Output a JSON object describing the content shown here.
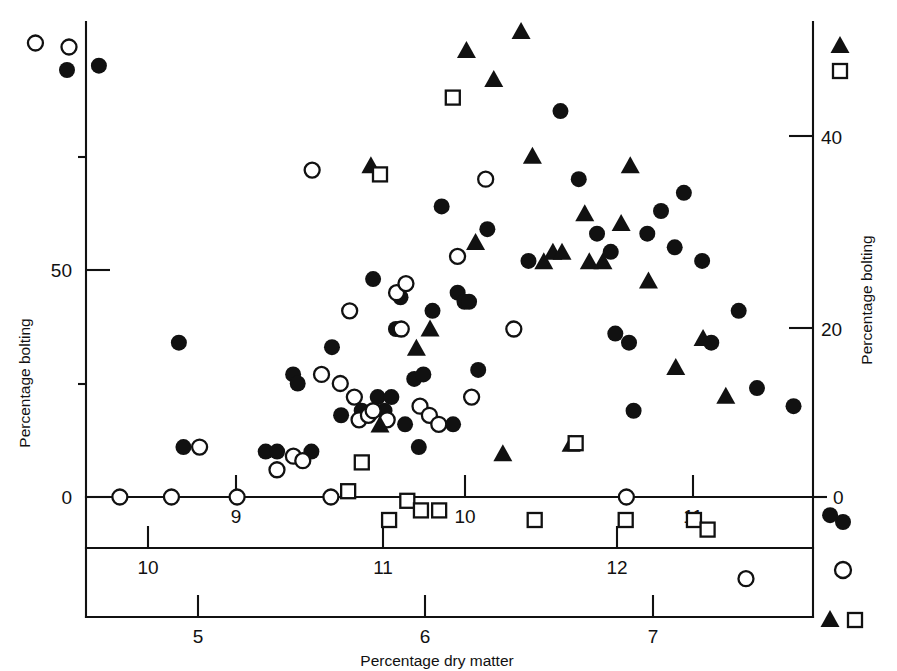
{
  "figure": {
    "background": "#ffffff",
    "ink_color": "#111111"
  },
  "chart_data": {
    "type": "scatter",
    "title": "",
    "xlabel": "Percentage dry matter",
    "ylabel": "Percentage bolting",
    "ylabel_right": "Percentage bolting",
    "grid": false,
    "legend_position": "axis-end-markers",
    "axes": {
      "y_left": {
        "label": "Percentage bolting",
        "ticks": [
          0,
          50
        ],
        "tick_labels": [
          "0",
          "50"
        ],
        "minor_ticks": [
          25,
          75
        ],
        "range": [
          0,
          100
        ],
        "series_markers": [
          "open-circle",
          "filled-circle"
        ]
      },
      "y_right": {
        "label": "Percentage bolting",
        "ticks": [
          20,
          40
        ],
        "tick_labels": [
          "20",
          "40"
        ],
        "range": [
          0,
          52
        ],
        "series_markers": [
          "filled-triangle",
          "open-square"
        ]
      },
      "x_bottom": {
        "label": "Percentage dry matter",
        "ticks": [
          5,
          6,
          7
        ],
        "tick_labels": [
          "5",
          "6",
          "7"
        ],
        "range": [
          4.45,
          7.65
        ],
        "series_markers": [
          "filled-triangle",
          "open-square"
        ]
      },
      "x_middle": {
        "ticks": [
          10,
          11,
          12
        ],
        "tick_labels": [
          "10",
          "11",
          "12"
        ],
        "range": [
          9.5,
          12.6
        ],
        "series_markers": [
          "open-circle"
        ]
      },
      "x_top": {
        "ticks": [
          9,
          10,
          11
        ],
        "tick_labels": [
          "9",
          "10",
          "11"
        ],
        "range": [
          8.4,
          11.6
        ],
        "series_markers": [
          "filled-circle"
        ]
      }
    },
    "series": [
      {
        "name": "Filled circles",
        "marker": "filled-circle",
        "x_axis": "x_top",
        "y_axis": "y_left",
        "count": 47,
        "points": [
          [
            8.4,
            95
          ],
          [
            8.75,
            34
          ],
          [
            8.77,
            11
          ],
          [
            9.13,
            10
          ],
          [
            9.18,
            10
          ],
          [
            9.25,
            27
          ],
          [
            9.27,
            25
          ],
          [
            9.33,
            10
          ],
          [
            9.42,
            33
          ],
          [
            9.46,
            18
          ],
          [
            9.55,
            19
          ],
          [
            9.6,
            48
          ],
          [
            9.62,
            22
          ],
          [
            9.65,
            19
          ],
          [
            9.68,
            22
          ],
          [
            9.7,
            37
          ],
          [
            9.72,
            44
          ],
          [
            9.74,
            16
          ],
          [
            9.78,
            26
          ],
          [
            9.8,
            11
          ],
          [
            9.82,
            27
          ],
          [
            9.86,
            41
          ],
          [
            9.9,
            64
          ],
          [
            9.95,
            16
          ],
          [
            9.97,
            45
          ],
          [
            10.0,
            43
          ],
          [
            10.02,
            43
          ],
          [
            10.06,
            28
          ],
          [
            10.1,
            59
          ],
          [
            10.28,
            52
          ],
          [
            10.42,
            85
          ],
          [
            10.5,
            70
          ],
          [
            10.58,
            58
          ],
          [
            10.64,
            54
          ],
          [
            10.66,
            36
          ],
          [
            10.72,
            34
          ],
          [
            10.74,
            19
          ],
          [
            10.8,
            58
          ],
          [
            10.86,
            63
          ],
          [
            10.92,
            55
          ],
          [
            10.96,
            67
          ],
          [
            11.04,
            52
          ],
          [
            11.08,
            34
          ],
          [
            11.2,
            41
          ],
          [
            11.28,
            24
          ],
          [
            11.44,
            20
          ],
          [
            11.6,
            -4
          ]
        ]
      },
      {
        "name": "Open circles",
        "marker": "open-circle",
        "x_axis": "x_middle",
        "y_axis": "y_left",
        "count": 30,
        "points": [
          [
            9.52,
            100
          ],
          [
            9.88,
            0
          ],
          [
            10.1,
            0
          ],
          [
            10.22,
            11
          ],
          [
            10.38,
            0
          ],
          [
            10.55,
            6
          ],
          [
            10.62,
            9
          ],
          [
            10.66,
            8
          ],
          [
            10.7,
            72
          ],
          [
            10.74,
            27
          ],
          [
            10.78,
            0
          ],
          [
            10.82,
            25
          ],
          [
            10.86,
            41
          ],
          [
            10.88,
            22
          ],
          [
            10.9,
            17
          ],
          [
            10.94,
            18
          ],
          [
            10.96,
            19
          ],
          [
            11.02,
            17
          ],
          [
            11.06,
            45
          ],
          [
            11.08,
            37
          ],
          [
            11.1,
            47
          ],
          [
            11.16,
            20
          ],
          [
            11.2,
            18
          ],
          [
            11.24,
            16
          ],
          [
            11.32,
            53
          ],
          [
            11.38,
            22
          ],
          [
            11.44,
            70
          ],
          [
            11.56,
            37
          ],
          [
            12.04,
            0
          ],
          [
            12.55,
            -18
          ]
        ]
      },
      {
        "name": "Filled triangles",
        "marker": "filled-triangle",
        "x_axis": "x_bottom",
        "y_axis": "y_right",
        "count": 23,
        "points": [
          [
            5.76,
            37
          ],
          [
            5.8,
            10
          ],
          [
            5.96,
            18
          ],
          [
            6.02,
            20
          ],
          [
            6.18,
            49
          ],
          [
            6.22,
            29
          ],
          [
            6.3,
            46
          ],
          [
            6.34,
            7
          ],
          [
            6.42,
            51
          ],
          [
            6.47,
            38
          ],
          [
            6.52,
            27
          ],
          [
            6.56,
            28
          ],
          [
            6.6,
            28
          ],
          [
            6.64,
            8
          ],
          [
            6.7,
            32
          ],
          [
            6.72,
            27
          ],
          [
            6.78,
            27
          ],
          [
            6.86,
            31
          ],
          [
            6.9,
            37
          ],
          [
            6.98,
            25
          ],
          [
            7.1,
            16
          ],
          [
            7.22,
            19
          ],
          [
            7.32,
            13
          ]
        ]
      },
      {
        "name": "Open squares",
        "marker": "open-square",
        "x_axis": "x_bottom",
        "y_axis": "y_right",
        "count": 13,
        "points": [
          [
            5.66,
            3
          ],
          [
            5.72,
            6
          ],
          [
            5.8,
            36
          ],
          [
            5.84,
            0
          ],
          [
            5.92,
            2
          ],
          [
            5.98,
            1
          ],
          [
            6.06,
            1
          ],
          [
            6.12,
            44
          ],
          [
            6.48,
            0
          ],
          [
            6.66,
            8
          ],
          [
            6.88,
            0
          ],
          [
            7.18,
            0
          ],
          [
            7.24,
            -1
          ]
        ]
      }
    ]
  }
}
